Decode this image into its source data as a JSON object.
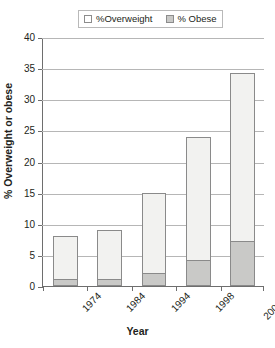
{
  "chart_data": {
    "type": "bar",
    "subtype": "stacked",
    "title": "",
    "xlabel": "Year",
    "ylabel": "% Overweight or obese",
    "categories": [
      "1974",
      "1984",
      "1994",
      "1998",
      "2001–2"
    ],
    "series": [
      {
        "name": "%Overweight",
        "values": [
          7,
          8,
          13,
          20,
          27.2
        ],
        "color": "#f2f2f0"
      },
      {
        "name": "% Obese",
        "values": [
          1,
          1,
          2,
          4,
          7
        ],
        "color": "#c9c9c7"
      }
    ],
    "totals": [
      8,
      9,
      15,
      24,
      34.2
    ],
    "ylim": [
      0,
      40
    ],
    "ytick_step": 5,
    "yticks": [
      "0",
      "5",
      "10",
      "15",
      "20",
      "25",
      "30",
      "35",
      "40"
    ],
    "grid": "horizontal",
    "legend_position": "top-center",
    "legend": [
      {
        "label": "%Overweight",
        "swatch": "#ffffff"
      },
      {
        "label": "% Obese",
        "swatch": "#c9c9c7"
      }
    ]
  }
}
